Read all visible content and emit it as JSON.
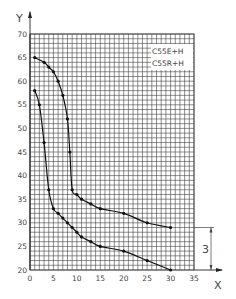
{
  "chart_data": {
    "type": "line",
    "title": "",
    "xlabel": "X",
    "ylabel": "Y",
    "xlim": [
      0,
      35
    ],
    "ylim": [
      20,
      70
    ],
    "xticks": [
      0,
      5,
      10,
      15,
      20,
      25,
      30,
      35
    ],
    "yticks": [
      20,
      25,
      30,
      35,
      40,
      45,
      50,
      55,
      60,
      65,
      70
    ],
    "grid": true,
    "grid_minor_step": 1,
    "legend_position": "upper-right",
    "series": [
      {
        "name": "C55E+H",
        "x": [
          1,
          3,
          4,
          5,
          6,
          7,
          8,
          8.5,
          9,
          10,
          11,
          13,
          15,
          20,
          25,
          30
        ],
        "y": [
          65,
          64,
          63,
          62,
          60,
          57,
          52,
          45,
          37,
          36,
          35,
          34,
          33,
          32,
          30,
          29
        ]
      },
      {
        "name": "C55R+H",
        "x": [
          1,
          2,
          3,
          4,
          5,
          6,
          7,
          8,
          9,
          10,
          11,
          13,
          15,
          20,
          25,
          30
        ],
        "y": [
          58,
          55,
          47,
          37,
          33,
          32,
          31,
          30,
          29,
          28,
          27,
          26,
          25,
          24,
          22,
          20
        ]
      }
    ],
    "annotations": [
      {
        "type": "dimension",
        "label": "3",
        "from_y": 29,
        "to_y": 20,
        "position": "right-of-plot"
      }
    ]
  },
  "colors": {
    "line": "#111111",
    "grid": "#333333",
    "text": "#444444"
  }
}
